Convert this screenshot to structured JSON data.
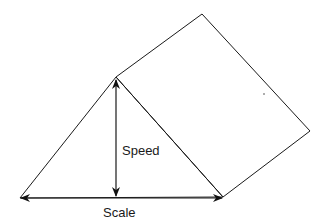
{
  "diagram": {
    "type": "geometric-schematic",
    "labels": {
      "vertical_arrow": "Speed",
      "horizontal_arrow": "Scale"
    },
    "shapes": {
      "triangle": {
        "points": [
          [
            20,
            198
          ],
          [
            116,
            77
          ],
          [
            223,
            197
          ]
        ]
      },
      "square": {
        "points": [
          [
            116,
            77
          ],
          [
            202,
            14
          ],
          [
            310,
            131
          ],
          [
            223,
            197
          ]
        ]
      },
      "vertical_arrow": {
        "from": [
          116,
          79
        ],
        "to": [
          116,
          196
        ],
        "double_headed": true
      },
      "horizontal_arrow": {
        "from": [
          20,
          198
        ],
        "to": [
          222,
          198
        ],
        "double_headed": true
      },
      "dot": [
        264,
        94
      ]
    },
    "colors": {
      "line": "#1a1a1a",
      "background": "#ffffff"
    }
  }
}
